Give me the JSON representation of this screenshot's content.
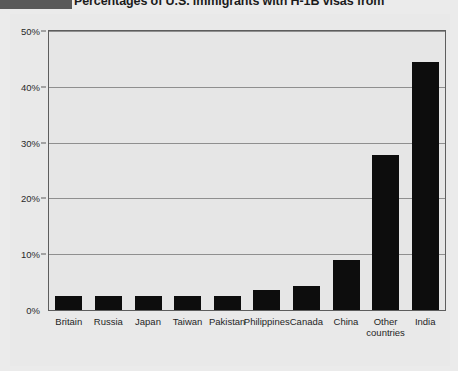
{
  "header": {
    "title_main": "Percentages of U.S. immigrants with H-1B visas from ",
    "title_clipped": "Percentages of U.S. immigrants with H-1B visas from"
  },
  "chart_data": {
    "type": "bar",
    "title": "Percentages of U.S. immigrants with H-1B visas from",
    "xlabel": "",
    "ylabel": "",
    "ylim": [
      0,
      50
    ],
    "grid": true,
    "legend": "none",
    "bar_color": "#0d0d0d",
    "plot_background": "#e6e6e6",
    "page_background": "#ebebeb",
    "categories": [
      "Britain",
      "Russia",
      "Japan",
      "Taiwan",
      "Pakistan",
      "Philippines",
      "Canada",
      "China",
      "Other countries",
      "India"
    ],
    "values": [
      2.5,
      2.5,
      2.5,
      2.5,
      2.5,
      3.5,
      4.3,
      9.0,
      27.8,
      44.5
    ],
    "ytick_labels": [
      "0%",
      "10%",
      "20%",
      "30%",
      "40%",
      "50%"
    ],
    "ytick_values": [
      0,
      10,
      20,
      30,
      40,
      50
    ]
  }
}
